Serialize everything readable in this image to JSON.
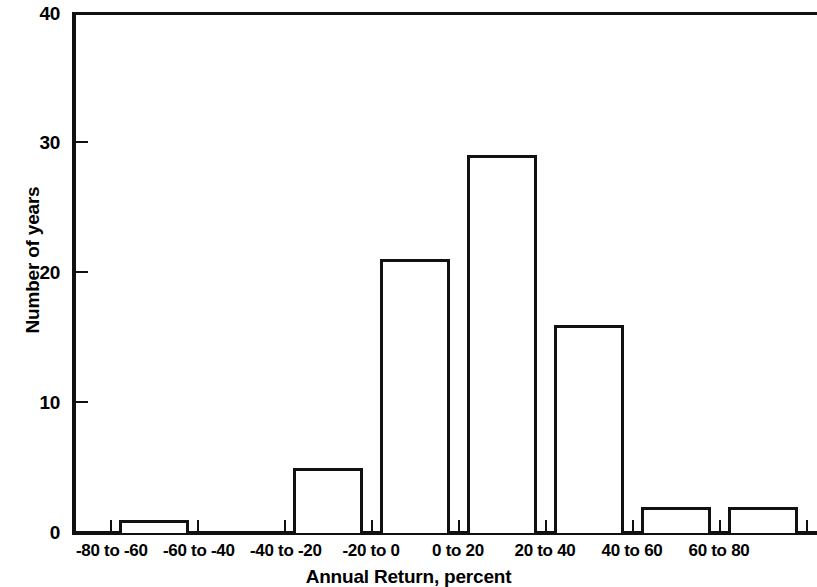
{
  "chart_data": {
    "type": "bar",
    "title": "",
    "subtitle": "",
    "xlabel": "Annual Return, percent",
    "ylabel": "Number of years",
    "categories": [
      "-80 to -60",
      "-60 to -40",
      "-40 to -20",
      "-20 to 0",
      "0 to 20",
      "20 to 40",
      "40 to 60",
      "60 to 80"
    ],
    "values": [
      1,
      0,
      5,
      21,
      29,
      16,
      2,
      2
    ],
    "ylim": [
      0,
      40
    ],
    "ytick_labels": [
      "0",
      "10",
      "20",
      "30",
      "40"
    ],
    "ytick_values": [
      0,
      10,
      20,
      30,
      40
    ],
    "grid": false,
    "legend": "none",
    "bar_style": "outline",
    "bar_color": "#ffffff",
    "bar_edge_color": "#111111",
    "background": "#ffffff",
    "axis_color": "#111111"
  }
}
